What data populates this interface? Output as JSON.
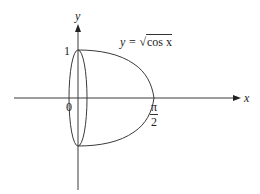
{
  "figure": {
    "axes": {
      "x_label": "x",
      "y_label": "y",
      "origin_label": "0",
      "y_tick_label": "1",
      "x_tick_label_numerator": "π",
      "x_tick_label_denominator": "2"
    },
    "curve": {
      "equation_lhs": "y = ",
      "equation_radical": "√",
      "equation_radicand": "cos x",
      "x_range": [
        0,
        1.5708
      ],
      "y_range": [
        -1,
        1
      ]
    },
    "colors": {
      "stroke": "#3a3a3a",
      "text": "#222222",
      "background": "#ffffff"
    }
  }
}
